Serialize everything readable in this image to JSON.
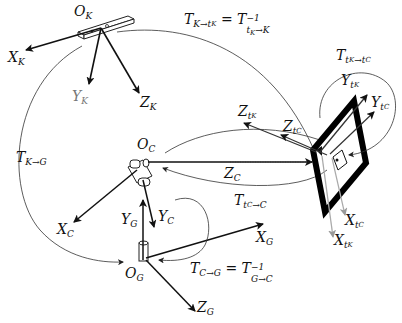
{
  "diagram": {
    "type": "coordinate-frames-transformations",
    "frames": {
      "kinect": {
        "origin": "O_K",
        "origin_main": "O",
        "origin_sub": "K",
        "axes": [
          {
            "main": "X",
            "sub": "K",
            "color": "#111111"
          },
          {
            "main": "Y",
            "sub": "K",
            "color": "#777777"
          },
          {
            "main": "Z",
            "sub": "K",
            "color": "#111111"
          }
        ]
      },
      "camera": {
        "origin": "O_C",
        "origin_main": "O",
        "origin_sub": "C",
        "axes": [
          {
            "main": "X",
            "sub": "C"
          },
          {
            "main": "Y",
            "sub": "C"
          },
          {
            "main": "Z",
            "sub": "C"
          }
        ]
      },
      "ground": {
        "origin": "O_G",
        "origin_main": "O",
        "origin_sub": "G",
        "axes": [
          {
            "main": "X",
            "sub": "G"
          },
          {
            "main": "Y",
            "sub": "G"
          },
          {
            "main": "Z",
            "sub": "G"
          }
        ]
      },
      "target_kinect": {
        "axes": [
          {
            "main": "X",
            "sub": "t",
            "subsub": "K"
          },
          {
            "main": "Y",
            "sub": "t",
            "subsub": "K"
          },
          {
            "main": "Z",
            "sub": "t",
            "subsub": "K"
          }
        ]
      },
      "target_camera": {
        "axes": [
          {
            "main": "X",
            "sub": "t",
            "subsub": "C"
          },
          {
            "main": "Y",
            "sub": "t",
            "subsub": "C"
          },
          {
            "main": "Z",
            "sub": "t",
            "subsub": "C"
          }
        ]
      }
    },
    "transforms": {
      "k_to_tk": {
        "lhs": "T",
        "lhs_sub": "K→t",
        "lhs_subsub": "K",
        "eq": " = ",
        "rhs": "T",
        "rhs_sup": "−1",
        "rhs_sub": "t",
        "rhs_subsub": "K",
        "rhs_sub2": "→K"
      },
      "tk_to_tc": {
        "main": "T",
        "sub": "t",
        "subsub": "K",
        "sub2": "→t",
        "subsub2": "C"
      },
      "k_to_g": {
        "main": "T",
        "sub": "K→G"
      },
      "tc_to_c": {
        "main": "T",
        "sub": "t",
        "subsub": "C",
        "sub2": "→C"
      },
      "c_to_g": {
        "lhs": "T",
        "lhs_sub": "C→G",
        "eq": " = ",
        "rhs": "T",
        "rhs_sup": "−1",
        "rhs_sub": "G→C"
      }
    }
  }
}
